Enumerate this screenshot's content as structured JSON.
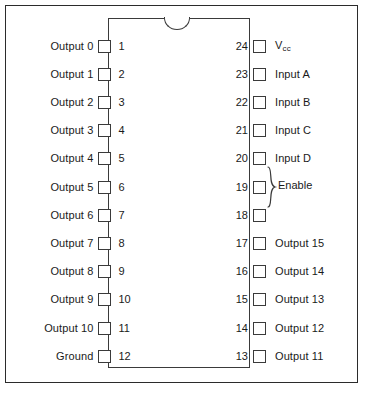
{
  "figure": {
    "colors": {
      "ink": "#2b2b2b",
      "background": "#ffffff"
    },
    "package": {
      "type": "DIP",
      "pin_count": 24,
      "notch": "top-center-notch"
    }
  },
  "left_pins": [
    {
      "number": "1",
      "label": "Output 0"
    },
    {
      "number": "2",
      "label": "Output 1"
    },
    {
      "number": "3",
      "label": "Output 2"
    },
    {
      "number": "4",
      "label": "Output 3"
    },
    {
      "number": "5",
      "label": "Output 4"
    },
    {
      "number": "6",
      "label": "Output 5"
    },
    {
      "number": "7",
      "label": "Output 6"
    },
    {
      "number": "8",
      "label": "Output 7"
    },
    {
      "number": "9",
      "label": "Output 8"
    },
    {
      "number": "10",
      "label": "Output 9"
    },
    {
      "number": "11",
      "label": "Output 10"
    },
    {
      "number": "12",
      "label": "Ground"
    }
  ],
  "right_pins": [
    {
      "number": "24",
      "label": "V",
      "sub": "cc"
    },
    {
      "number": "23",
      "label": "Input A",
      "sub": ""
    },
    {
      "number": "22",
      "label": "Input B",
      "sub": ""
    },
    {
      "number": "21",
      "label": "Input C",
      "sub": ""
    },
    {
      "number": "20",
      "label": "Input D",
      "sub": ""
    },
    {
      "number": "19",
      "label": "",
      "sub": ""
    },
    {
      "number": "18",
      "label": "",
      "sub": ""
    },
    {
      "number": "17",
      "label": "Output 15",
      "sub": ""
    },
    {
      "number": "16",
      "label": "Output 14",
      "sub": ""
    },
    {
      "number": "15",
      "label": "Output 13",
      "sub": ""
    },
    {
      "number": "14",
      "label": "Output 12",
      "sub": ""
    },
    {
      "number": "13",
      "label": "Output 11",
      "sub": ""
    }
  ],
  "groups": [
    {
      "label": "Enable",
      "pins": [
        "19",
        "18"
      ]
    }
  ]
}
